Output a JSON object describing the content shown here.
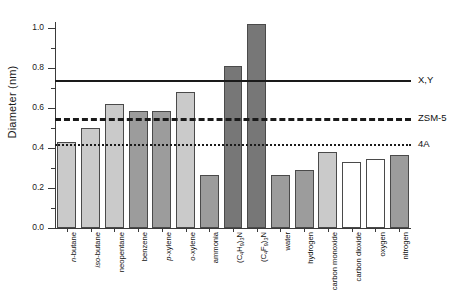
{
  "chart_data": {
    "type": "bar",
    "title": "",
    "xlabel": "",
    "ylabel": "Diameter (nm)",
    "ylim": [
      0.0,
      1.1
    ],
    "yticks": [
      "0.0",
      "0.2",
      "0.4",
      "0.6",
      "0.8",
      "1.0"
    ],
    "grid": false,
    "legend_position": "right",
    "categories": [
      "n-butane",
      "iso-butane",
      "neopentane",
      "benzene",
      "p-xylene",
      "o-xylene",
      "ammonia",
      "(C4H9)3N",
      "(C4F9)3N",
      "water",
      "hydrogen",
      "carbon monoxide",
      "carbon dioxide",
      "oxygen",
      "nitrogen"
    ],
    "values": [
      0.43,
      0.5,
      0.62,
      0.585,
      0.585,
      0.68,
      0.265,
      0.81,
      1.02,
      0.265,
      0.29,
      0.38,
      0.33,
      0.345,
      0.365
    ],
    "bar_fills": [
      "light",
      "light",
      "light",
      "mid",
      "mid",
      "light",
      "mid",
      "dark",
      "dark",
      "mid",
      "mid",
      "light",
      "white",
      "white",
      "mid"
    ],
    "reference_lines": [
      {
        "label": "X,Y",
        "value": 0.74,
        "style": "solid"
      },
      {
        "label": "ZSM-5",
        "value": 0.55,
        "style": "dashed"
      },
      {
        "label": "4A",
        "value": 0.42,
        "style": "dotted"
      }
    ]
  },
  "labels_html": [
    "<span class=\"it\">n</span>-butane",
    "<span class=\"it\">iso</span>-butane",
    "neopentane",
    "benzene",
    "<span class=\"it\">p</span>-xylene",
    "<span class=\"it\">o</span>-xylene",
    "ammonia",
    "(C<sub>4</sub>H<sub>9</sub>)<sub>3</sub>N",
    "(C<sub>4</sub>F<sub>9</sub>)<sub>3</sub>N",
    "water",
    "hydrogen",
    "carbon monoxide",
    "carbon dioxide",
    "oxygen",
    "nitrogen"
  ],
  "colors": {
    "light": "#cacaca",
    "mid": "#9c9c9c",
    "dark": "#777777",
    "white": "#ffffff",
    "axis": "#3a3a3a",
    "line": "#1a1a1a"
  }
}
